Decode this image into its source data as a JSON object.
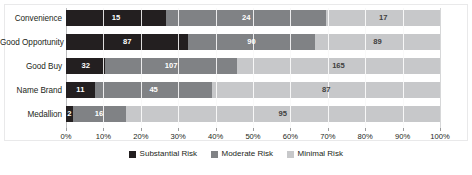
{
  "chart_data": {
    "type": "bar",
    "subtype": "100%-stacked-horizontal-bar",
    "title": "",
    "xlabel": "",
    "ylabel": "",
    "categories": [
      "Convenience",
      "Good Opportunity",
      "Good Buy",
      "Name Brand",
      "Medallion"
    ],
    "series": [
      {
        "name": "Substantial Risk",
        "color": "#231f20",
        "values": [
          15,
          87,
          32,
          11,
          2
        ]
      },
      {
        "name": "Moderate Risk",
        "color": "#808285",
        "values": [
          24,
          90,
          107,
          45,
          16
        ]
      },
      {
        "name": "Minimal Risk",
        "color": "#c7c8ca",
        "values": [
          17,
          89,
          165,
          87,
          95
        ]
      }
    ],
    "row_totals": [
      56,
      266,
      304,
      143,
      113
    ],
    "xlim": [
      0,
      100
    ],
    "xticks": [
      0,
      10,
      20,
      30,
      40,
      50,
      60,
      70,
      80,
      90,
      100
    ],
    "xticklabels": [
      "0%",
      "10%",
      "20%",
      "30%",
      "40%",
      "50%",
      "60%",
      "70%",
      "80%",
      "90%",
      "100%"
    ],
    "grid": true,
    "legend_position": "bottom-center"
  },
  "legend": {
    "items": [
      {
        "label": "Substantial Risk",
        "color": "#231f20"
      },
      {
        "label": "Moderate Risk",
        "color": "#808285"
      },
      {
        "label": "Minimal Risk",
        "color": "#c7c8ca"
      }
    ]
  }
}
